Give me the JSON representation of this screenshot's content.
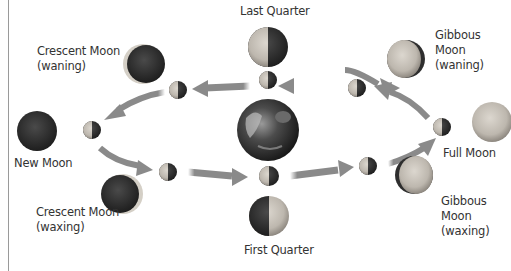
{
  "diagram": {
    "title_fragment": "...g...",
    "center": {
      "name": "Earth"
    },
    "phases": [
      {
        "id": "last-quarter",
        "label": "Last Quarter"
      },
      {
        "id": "gibbous-waning",
        "label_lines": [
          "Gibbous",
          "Moon",
          "(waning)"
        ]
      },
      {
        "id": "full-moon",
        "label": "Full Moon"
      },
      {
        "id": "gibbous-waxing",
        "label_lines": [
          "Gibbous",
          "Moon",
          "(waxing)"
        ]
      },
      {
        "id": "first-quarter",
        "label": "First Quarter"
      },
      {
        "id": "crescent-waxing",
        "label_lines": [
          "Crescent Moon",
          "(waxing)"
        ]
      },
      {
        "id": "new-moon",
        "label": "New Moon"
      },
      {
        "id": "crescent-waning",
        "label_lines": [
          "Crescent Moon",
          "(waning)"
        ]
      }
    ],
    "orbit_direction": "counterclockwise",
    "colors": {
      "arrow": "#8a8a8a",
      "moon_lit": "#c9c4bc",
      "moon_dark": "#3a3a3a",
      "text": "#333333"
    }
  }
}
